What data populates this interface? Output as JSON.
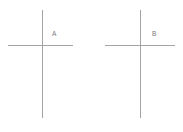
{
  "figure": {
    "background_color": "#ffffff",
    "line_color": "#9a9a9a",
    "label_color": "#777777",
    "width": 183,
    "height": 132
  },
  "chart_data": {
    "type": "diagram",
    "title": "",
    "xlabel": "",
    "ylabel": "",
    "grid": false,
    "legend": null,
    "items": [
      {
        "label": "A",
        "label_x": 52,
        "label_y": 36,
        "vertical": {
          "x": 42.5,
          "y1": 10,
          "y2": 118
        },
        "horizontal": {
          "y": 45.5,
          "x1": 8,
          "x2": 73
        }
      },
      {
        "label": "B",
        "label_x": 152,
        "label_y": 36,
        "vertical": {
          "x": 140.5,
          "y1": 10,
          "y2": 118
        },
        "horizontal": {
          "y": 45.5,
          "x1": 105,
          "x2": 175
        }
      }
    ]
  }
}
